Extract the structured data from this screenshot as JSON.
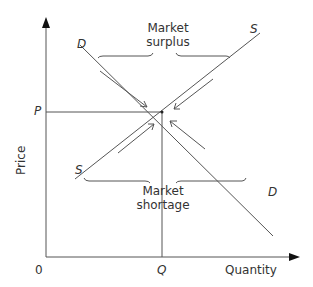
{
  "diagram": {
    "axes": {
      "y_label": "Price",
      "x_label": "Quantity",
      "origin_label": "0",
      "price_label": "P",
      "quantity_label": "Q"
    },
    "curves": {
      "demand_label": "D",
      "supply_label": "S"
    },
    "annotations": {
      "surplus_line1": "Market",
      "surplus_line2": "surplus",
      "shortage_line1": "Market",
      "shortage_line2": "shortage"
    },
    "colors": {
      "line": "#444444",
      "text": "#333333",
      "background": "#ffffff"
    }
  }
}
